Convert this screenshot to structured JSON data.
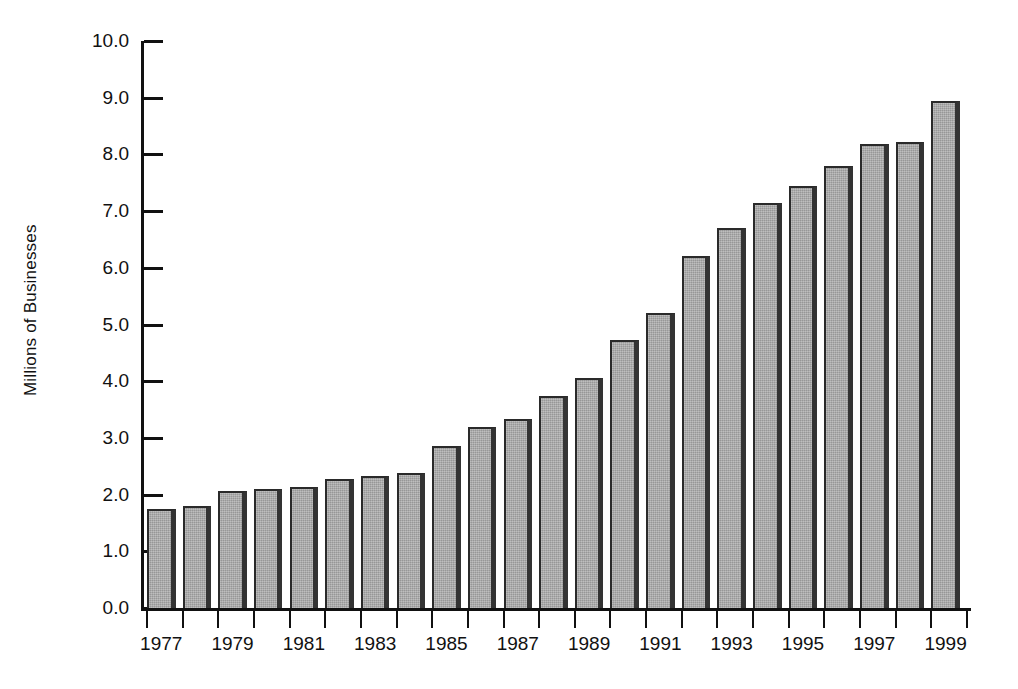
{
  "chart_data": {
    "type": "bar",
    "title": "",
    "subtitle": "",
    "xlabel": "",
    "ylabel": "Millions of Businesses",
    "ylim": [
      0.0,
      10.0
    ],
    "xlim_years": [
      1977,
      1999
    ],
    "grid": false,
    "legend": null,
    "y_ticks": [
      "0.0",
      "1.0",
      "2.0",
      "3.0",
      "4.0",
      "5.0",
      "6.0",
      "7.0",
      "8.0",
      "9.0",
      "10.0"
    ],
    "y_tick_values": [
      0.0,
      1.0,
      2.0,
      3.0,
      4.0,
      5.0,
      6.0,
      7.0,
      8.0,
      9.0,
      10.0
    ],
    "x_tick_labels": [
      "1977",
      "",
      "1979",
      "",
      "1981",
      "",
      "1983",
      "",
      "1985",
      "",
      "1987",
      "",
      "1989",
      "",
      "1991",
      "",
      "1993",
      "",
      "1995",
      "",
      "1997",
      "",
      "1999"
    ],
    "categories": [
      "1977",
      "1978",
      "1979",
      "1980",
      "1981",
      "1982",
      "1983",
      "1984",
      "1985",
      "1986",
      "1987",
      "1988",
      "1989",
      "1990",
      "1991",
      "1992",
      "1993",
      "1994",
      "1995",
      "1996",
      "1997",
      "1998",
      "1999"
    ],
    "values": [
      1.75,
      1.8,
      2.07,
      2.1,
      2.14,
      2.28,
      2.32,
      2.38,
      2.86,
      3.2,
      3.34,
      3.74,
      4.05,
      4.72,
      5.2,
      6.2,
      6.7,
      7.15,
      7.45,
      7.8,
      8.18,
      8.22,
      8.95
    ],
    "bar_fill_color": "#a9a9a9",
    "bar_border_color": "#2a2a2a",
    "axis_color": "#111111",
    "background_color": "#ffffff"
  }
}
